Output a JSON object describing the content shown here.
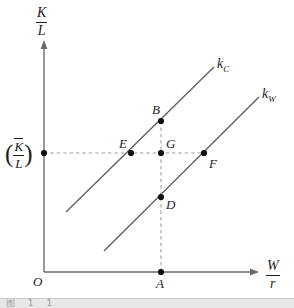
{
  "figure": {
    "background_color": "#ffffff",
    "line_color": "#5a5a5a",
    "axis_color": "#6b6b6b",
    "dash_color": "#9a9a9a",
    "point_color": "#111111"
  },
  "axes": {
    "y_label": {
      "numerator": "K",
      "denominator": "L"
    },
    "x_label": {
      "numerator": "W",
      "denominator": "r"
    },
    "origin_label": "O",
    "y_tick_label": {
      "open_paren": "(",
      "numerator": "K",
      "denominator": "L",
      "close_paren": ")"
    }
  },
  "curves": [
    {
      "id": "kC",
      "label_base": "k",
      "label_sub": "C",
      "description": "upper steeper line (cloth sector)"
    },
    {
      "id": "kW",
      "label_base": "k",
      "label_sub": "W",
      "description": "lower line (wheat sector)"
    }
  ],
  "points": [
    {
      "id": "A",
      "label": "A",
      "note": "on horizontal axis below D"
    },
    {
      "id": "B",
      "label": "B",
      "note": "on kC above G"
    },
    {
      "id": "D",
      "label": "D",
      "note": "on kW below G"
    },
    {
      "id": "E",
      "label": "E",
      "note": "intersection of kC with K/L level"
    },
    {
      "id": "F",
      "label": "F",
      "note": "intersection of kW with K/L level"
    },
    {
      "id": "G",
      "label": "G",
      "note": "on K/L level at the A abscissa"
    }
  ],
  "bottom_strip": {
    "ghost_text": "图 1 1 "
  }
}
